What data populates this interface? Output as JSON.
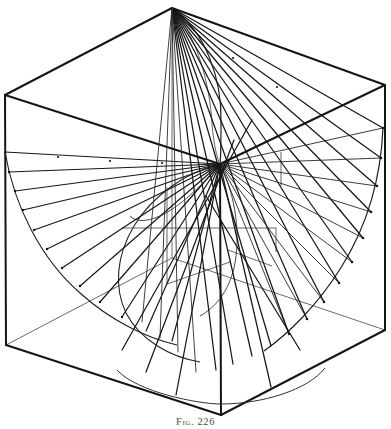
{
  "figure": {
    "caption": "Fig. 226",
    "domain_note": "descriptive-geometry line drawing",
    "background_color": "#ffffff",
    "ink_color": "#1a1a1a",
    "light_ink_color": "#555555",
    "canvas": {
      "width": 391,
      "height": 429
    }
  },
  "geometry": {
    "cube_vertices": {
      "top_back": [
        172,
        8
      ],
      "top_left": [
        5,
        95
      ],
      "top_right": [
        385,
        85
      ],
      "top_front": [
        220,
        164
      ],
      "bottom_left": [
        6,
        345
      ],
      "bottom_right": [
        385,
        330
      ],
      "bottom_front": [
        221,
        415
      ],
      "bottom_back_hidden": [
        172,
        258
      ]
    },
    "cube_edges": [
      {
        "name": "top-face-back-left",
        "from": "top_back",
        "to": "top_left",
        "style": "solid"
      },
      {
        "name": "top-face-back-right",
        "from": "top_back",
        "to": "top_right",
        "style": "solid"
      },
      {
        "name": "top-face-front-left",
        "from": "top_left",
        "to": "top_front",
        "style": "solid"
      },
      {
        "name": "top-face-front-right",
        "from": "top_front",
        "to": "top_right",
        "style": "solid"
      },
      {
        "name": "vertical-left",
        "from": "top_left",
        "to": "bottom_left",
        "style": "solid"
      },
      {
        "name": "vertical-right",
        "from": "top_right",
        "to": "bottom_right",
        "style": "solid"
      },
      {
        "name": "vertical-front",
        "from": "top_front",
        "to": "bottom_front",
        "style": "solid"
      },
      {
        "name": "vertical-back-hidden",
        "from": "top_back",
        "to": "bottom_back_hidden",
        "style": "thin"
      },
      {
        "name": "bottom-face-front-left",
        "from": "bottom_left",
        "to": "bottom_front",
        "style": "solid"
      },
      {
        "name": "bottom-face-front-right",
        "from": "bottom_front",
        "to": "bottom_right",
        "style": "solid"
      },
      {
        "name": "bottom-face-back-left",
        "from": "bottom_left",
        "to": "bottom_back_hidden",
        "style": "thin"
      },
      {
        "name": "bottom-face-back-right",
        "from": "bottom_back_hidden",
        "to": "bottom_right",
        "style": "thin"
      }
    ],
    "apex_upper": [
      172,
      8
    ],
    "apex_center": [
      220,
      164
    ],
    "directrix_left_start": [
      5,
      152
    ],
    "generator_counts": {
      "upper_right_fan": 14,
      "left_fan": 11,
      "lower_inner_fan": 12,
      "upper_inner_fan": 10
    },
    "curves": {
      "right_arc_label": "outer directrix arc, right",
      "left_arc_label": "outer directrix arc, left",
      "base_ellipse_label": "base circle in bottom face",
      "throat_curve_label": "throat curve of conoid",
      "top_curve_label": "curve from upper apex to centre"
    }
  }
}
